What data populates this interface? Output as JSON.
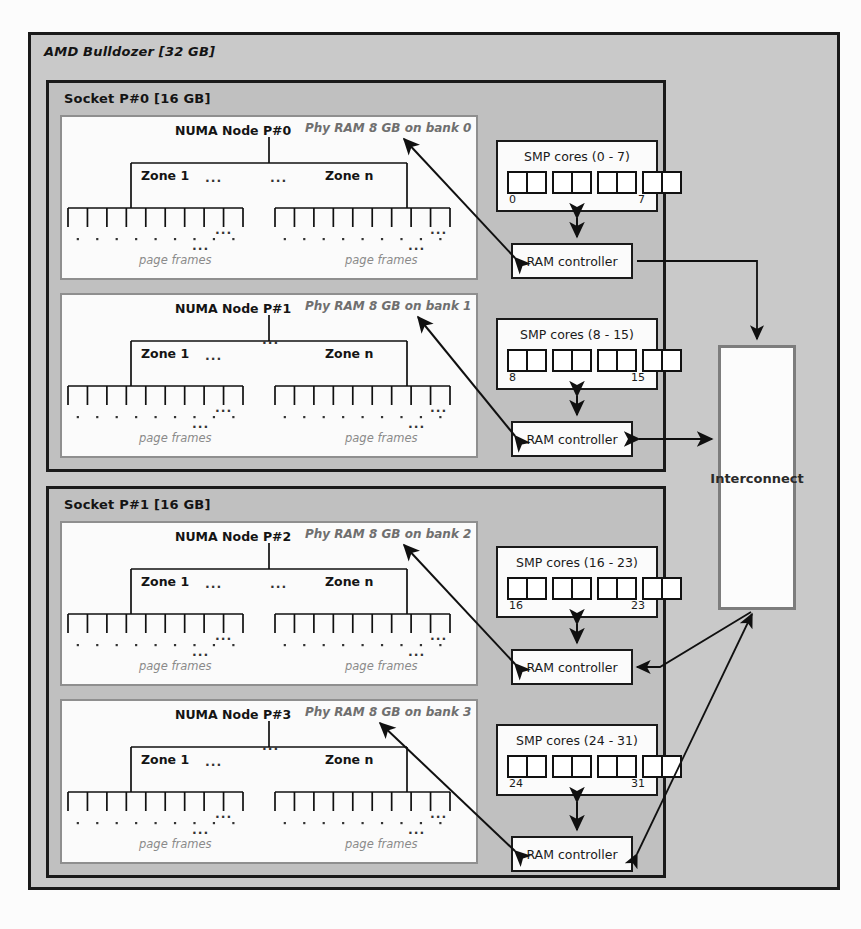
{
  "machine": {
    "title": "AMD Bulldozer [32 GB]"
  },
  "sockets": [
    {
      "title": "Socket P#0 [16 GB]"
    },
    {
      "title": "Socket P#1 [16 GB]"
    }
  ],
  "nodes": [
    {
      "title": "NUMA Node P#0",
      "phy": "Phy RAM 8 GB on bank 0",
      "zone_first": "Zone 1",
      "zone_last": "Zone n",
      "ellipsis": "...",
      "page_frames": "page frames"
    },
    {
      "title": "NUMA Node P#1",
      "phy": "Phy RAM 8 GB on bank 1",
      "zone_first": "Zone 1",
      "zone_last": "Zone n",
      "ellipsis": "...",
      "page_frames": "page frames"
    },
    {
      "title": "NUMA Node P#2",
      "phy": "Phy RAM 8 GB on bank 2",
      "zone_first": "Zone 1",
      "zone_last": "Zone n",
      "ellipsis": "...",
      "page_frames": "page frames"
    },
    {
      "title": "NUMA Node P#3",
      "phy": "Phy RAM 8 GB on bank 3",
      "zone_first": "Zone 1",
      "zone_last": "Zone n",
      "ellipsis": "...",
      "page_frames": "page frames"
    }
  ],
  "smp": [
    {
      "title": "SMP cores (0 - 7)",
      "first": "0",
      "last": "7",
      "groups": 4,
      "per_group": 2
    },
    {
      "title": "SMP cores (8 - 15)",
      "first": "8",
      "last": "15",
      "groups": 4,
      "per_group": 2
    },
    {
      "title": "SMP cores (16 - 23)",
      "first": "16",
      "last": "23",
      "groups": 4,
      "per_group": 2
    },
    {
      "title": "SMP cores (24 - 31)",
      "first": "24",
      "last": "31",
      "groups": 4,
      "per_group": 2
    }
  ],
  "ram_controllers": [
    {
      "label": "RAM controller"
    },
    {
      "label": "RAM controller"
    },
    {
      "label": "RAM controller"
    },
    {
      "label": "RAM controller"
    }
  ],
  "interconnect": {
    "label": "Interconnect"
  },
  "colors": {
    "machine_bg": "#c9c9c9",
    "socket_bg": "#c0c0c0",
    "node_bg": "#fbfbfb",
    "box_border": "#1a1a1a",
    "node_border": "#8f8f8f",
    "muted_text": "#8a8a8a",
    "phy_text": "#6f6f6f",
    "interconnect_border": "#7d7d7d"
  }
}
